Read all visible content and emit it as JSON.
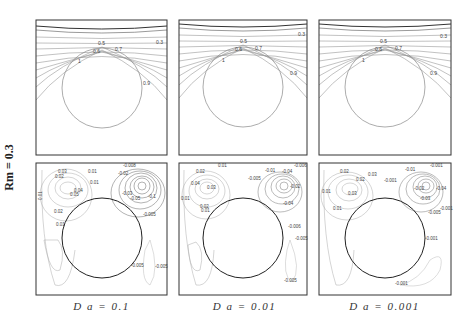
{
  "figure": {
    "row_label": "R_m = 0.3",
    "row_label_text": "Rm = 0.3",
    "columns": [
      {
        "caption": "Da = 0.1",
        "caption_text": "D a  =  0.1"
      },
      {
        "caption": "Da = 0.01",
        "caption_text": "D a  =  0.01"
      },
      {
        "caption": "Da = 0.001",
        "caption_text": "D a  =  0.001"
      }
    ],
    "top_row": {
      "description": "Isotherm contour plots",
      "contour_labels": [
        "0.3",
        "0.5",
        "0.6",
        "0.7",
        "0.8",
        "1"
      ]
    },
    "bottom_row": {
      "description": "Streamline contour plots",
      "panels": [
        {
          "labels": [
            "-0.008",
            "0.01",
            "0.02",
            "0.03",
            "0.04",
            "0.05",
            "0.01",
            "0.02",
            "0.03",
            "-0.005",
            "-0.03",
            "-0.005"
          ]
        },
        {
          "labels": [
            "0.01",
            "0.02",
            "0.04",
            "0.03",
            "0.01",
            "0.02",
            "-0.005",
            "-0.01",
            "-0.04",
            "-0.02",
            "-0.04",
            "-0.006",
            "-0.005",
            "-0.005"
          ]
        },
        {
          "labels": [
            "0.01",
            "0.02",
            "0.03",
            "0.02",
            "0.03",
            "0.01",
            "-0.001",
            "-0.01",
            "-0.02",
            "-0.03",
            "-0.04",
            "-0.005",
            "-0.001",
            "-0.001",
            "-0.001"
          ]
        }
      ]
    }
  }
}
